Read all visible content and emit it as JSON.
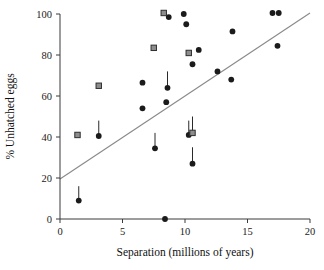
{
  "chart_data": {
    "type": "scatter",
    "title": "",
    "xlabel": "Separation (millions of years)",
    "ylabel": "% Unhatched eggs",
    "xlim": [
      0,
      20
    ],
    "ylim": [
      0,
      100
    ],
    "xticks": [
      0,
      5,
      10,
      15,
      20
    ],
    "yticks": [
      0,
      20,
      40,
      60,
      80,
      100
    ],
    "xtick_labels": [
      "0",
      "5",
      "10",
      "15",
      "20"
    ],
    "ytick_labels": [
      "0",
      "20",
      "40",
      "60",
      "80",
      "100"
    ],
    "grid": false,
    "legend": "none",
    "series": [
      {
        "name": "circle-points",
        "marker": "circle",
        "color": "#1b1b1b",
        "points": [
          {
            "x": 1.5,
            "y": 9.0,
            "err_up": 7.0
          },
          {
            "x": 3.1,
            "y": 40.5,
            "err_up": 7.5
          },
          {
            "x": 6.6,
            "y": 54.0,
            "err_up": 0
          },
          {
            "x": 6.6,
            "y": 66.5,
            "err_up": 0
          },
          {
            "x": 7.6,
            "y": 34.5,
            "err_up": 7.5
          },
          {
            "x": 8.4,
            "y": 0.0,
            "err_up": 0
          },
          {
            "x": 8.5,
            "y": 57.0,
            "err_up": 0
          },
          {
            "x": 8.6,
            "y": 64.0,
            "err_up": 8.0
          },
          {
            "x": 8.7,
            "y": 98.5,
            "err_up": 0
          },
          {
            "x": 9.9,
            "y": 100.0,
            "err_up": 0
          },
          {
            "x": 10.1,
            "y": 95.0,
            "err_up": 0
          },
          {
            "x": 10.3,
            "y": 41.0,
            "err_up": 7.0
          },
          {
            "x": 10.6,
            "y": 27.0,
            "err_up": 8.0
          },
          {
            "x": 10.6,
            "y": 75.5,
            "err_up": 0
          },
          {
            "x": 11.1,
            "y": 82.5,
            "err_up": 0
          },
          {
            "x": 12.6,
            "y": 72.0,
            "err_up": 0
          },
          {
            "x": 13.7,
            "y": 68.0,
            "err_up": 0
          },
          {
            "x": 13.8,
            "y": 91.5,
            "err_up": 0
          },
          {
            "x": 17.0,
            "y": 100.5,
            "err_up": 0
          },
          {
            "x": 17.5,
            "y": 100.5,
            "err_up": 0
          },
          {
            "x": 17.4,
            "y": 84.5,
            "err_up": 0
          }
        ]
      },
      {
        "name": "square-points",
        "marker": "square",
        "color": "#8d8d8d",
        "points": [
          {
            "x": 1.4,
            "y": 41.0,
            "err_up": 0
          },
          {
            "x": 3.1,
            "y": 65.0,
            "err_up": 0
          },
          {
            "x": 7.5,
            "y": 83.5,
            "err_up": 0
          },
          {
            "x": 8.3,
            "y": 100.5,
            "err_up": 0
          },
          {
            "x": 10.3,
            "y": 81.0,
            "err_up": 0
          },
          {
            "x": 10.6,
            "y": 42.0,
            "err_up": 8.0
          }
        ]
      }
    ],
    "fit_line": {
      "name": "regression-line",
      "color": "#8a8a8a",
      "x_start": 0.0,
      "y_start": 19.5,
      "x_end": 20.0,
      "y_end": 100.5
    }
  }
}
